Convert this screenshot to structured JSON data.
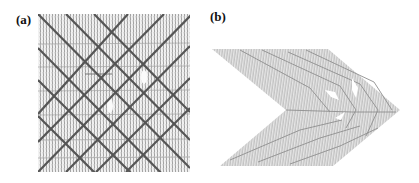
{
  "figure": {
    "panels": [
      {
        "label": "(a)",
        "description": "Square patch with dense vertical thin hatching, faint horizontal lines, and a grid of thick dark diagonal lines crossing at right angles",
        "diagonal_lines_per_direction": 6
      },
      {
        "label": "(b)",
        "description": "Chevron / arrowhead-shaped folded sheet pointing right, rendered with dense light-gray hatching and layered ridges"
      }
    ]
  }
}
